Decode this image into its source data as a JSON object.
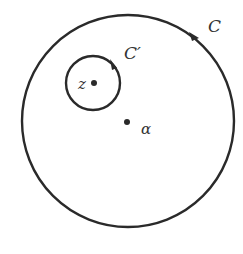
{
  "diagram": {
    "type": "contour-diagram",
    "stroke_color": "#2a2a2a",
    "outer_contour": {
      "label": "C",
      "cx": 128,
      "cy": 121,
      "r": 106,
      "orientation": "counterclockwise",
      "label_x": 208,
      "label_y": 32
    },
    "inner_contour": {
      "label": "C′",
      "cx": 93,
      "cy": 83,
      "r": 28,
      "orientation": "counterclockwise",
      "label_x": 124,
      "label_y": 59
    },
    "points": [
      {
        "label": "z",
        "x": 94,
        "y": 83,
        "label_x": 78,
        "label_y": 89
      },
      {
        "label": "α",
        "x": 127,
        "y": 122,
        "label_x": 141,
        "label_y": 134
      }
    ]
  }
}
